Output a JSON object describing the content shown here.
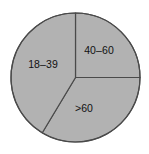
{
  "chart_data": {
    "type": "pie",
    "title": "",
    "subtitle": "",
    "xlabel": "",
    "ylabel": "",
    "grid": false,
    "legend_position": "none",
    "labels_inside_slices": true,
    "categories": [
      "40–60",
      ">60",
      "18–39"
    ],
    "values": [
      25,
      33.6,
      41.4
    ],
    "value_unit": "percent",
    "slices": [
      {
        "label": "40–60",
        "value": 25,
        "start_angle_deg": 0,
        "end_angle_deg": 90,
        "sweep_deg": 90,
        "fill": "#b2b2b2",
        "stroke": "#4a4a4a",
        "label_x": 99,
        "label_y": 50
      },
      {
        "label": ">60",
        "value": 33.6,
        "start_angle_deg": 90,
        "end_angle_deg": 211,
        "sweep_deg": 121,
        "fill": "#b2b2b2",
        "stroke": "#4a4a4a",
        "label_x": 84,
        "label_y": 108
      },
      {
        "label": "18–39",
        "value": 41.4,
        "start_angle_deg": 211,
        "end_angle_deg": 360,
        "sweep_deg": 149,
        "fill": "#b2b2b2",
        "stroke": "#4a4a4a",
        "label_x": 43,
        "label_y": 64
      }
    ],
    "geometry": {
      "center_x": 75.5,
      "center_y": 77.5,
      "radius": 64.5
    },
    "colors": {
      "background": "#ffffff",
      "slice_fill": "#b2b2b2",
      "outline": "#4a4a4a",
      "label_text": "#111111"
    }
  }
}
